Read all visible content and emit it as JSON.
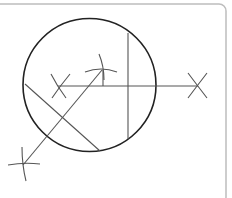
{
  "diagram": {
    "type": "geometric-construction",
    "colors": {
      "background": "#ffffff",
      "frame": "#bdbdbd",
      "circle": "#222222",
      "lines": "#555555",
      "arcs": "#555555"
    },
    "frame": {
      "x": -6,
      "y": 4,
      "width": 232,
      "height": 200,
      "radius": 7
    },
    "circle": {
      "cx": 89.5,
      "cy": 85,
      "r": 66.5
    },
    "lines": [
      {
        "name": "horizontal-line",
        "x1": 58,
        "y1": 86,
        "x2": 198,
        "y2": 86
      },
      {
        "name": "vertical-chord",
        "x1": 128,
        "y1": 33,
        "x2": 128,
        "y2": 139
      },
      {
        "name": "short-vertical-tick",
        "x1": 103,
        "y1": 70,
        "x2": 103,
        "y2": 86
      },
      {
        "name": "diagonal-bisector",
        "x1": 23,
        "y1": 165,
        "x2": 102,
        "y2": 70
      },
      {
        "name": "diagonal-chord",
        "x1": 25,
        "y1": 84,
        "x2": 100,
        "y2": 151
      }
    ],
    "arcs": [
      {
        "name": "left-mark-arc-a",
        "d": "M51 74 Q57 86 66 98"
      },
      {
        "name": "left-mark-arc-b",
        "d": "M70 74 Q60 86 52 98"
      },
      {
        "name": "right-mark-arc-a",
        "d": "M188 73 Q197 85 207 98"
      },
      {
        "name": "right-mark-arc-b",
        "d": "M207 73 Q197 86 188 98"
      },
      {
        "name": "top-mark-arc-horizontal",
        "d": "M85 72 Q101 66 117 72"
      },
      {
        "name": "top-mark-arc-vertical",
        "d": "M99 54 Q104 66 104 80"
      },
      {
        "name": "bottom-mark-arc-horizontal",
        "d": "M8 165 Q24 162 40 164"
      },
      {
        "name": "bottom-mark-arc-vertical",
        "d": "M22 147 Q22 165 26 181"
      }
    ]
  }
}
